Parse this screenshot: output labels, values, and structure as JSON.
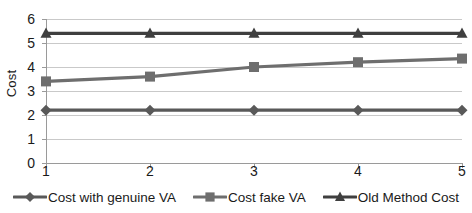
{
  "chart_data": {
    "type": "line",
    "title": "",
    "xlabel": "",
    "ylabel": "Cost",
    "x": [
      1,
      2,
      3,
      4,
      5
    ],
    "categories": [
      "1",
      "2",
      "3",
      "4",
      "5"
    ],
    "xlim": [
      1,
      5
    ],
    "ylim": [
      0,
      6
    ],
    "y_ticks": [
      0,
      1,
      2,
      3,
      4,
      5,
      6
    ],
    "y_tick_labels": [
      "0",
      "1",
      "2",
      "3",
      "4",
      "5",
      "6"
    ],
    "x_tick_labels": [
      "1",
      "2",
      "3",
      "4",
      "5"
    ],
    "grid": "horizontal",
    "legend_position": "bottom",
    "series": [
      {
        "name": "Cost with genuine VA",
        "marker": "diamond",
        "color": "#595959",
        "values": [
          2.2,
          2.2,
          2.2,
          2.2,
          2.2
        ]
      },
      {
        "name": "Cost fake VA",
        "marker": "square",
        "color": "#6e6e6e",
        "values": [
          3.4,
          3.6,
          4.0,
          4.2,
          4.35
        ]
      },
      {
        "name": "Old Method Cost",
        "marker": "triangle",
        "color": "#3f3f3f",
        "values": [
          5.4,
          5.4,
          5.4,
          5.4,
          5.4
        ]
      }
    ]
  },
  "axis": {
    "y_title": "Cost"
  },
  "colors": {
    "gridline": "#c9c9c9",
    "axis_line": "#9a9a9a",
    "background": "#ffffff",
    "text": "#1a1a1a"
  }
}
